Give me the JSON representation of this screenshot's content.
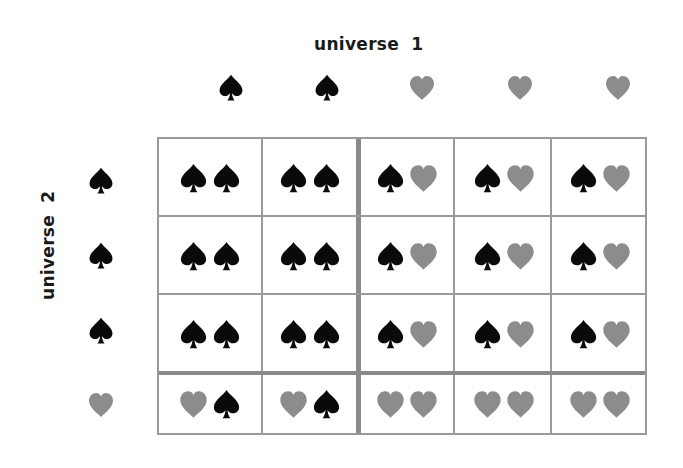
{
  "labels": {
    "universe1": "universe 1",
    "universe2": "universe 2"
  },
  "colors": {
    "spade": "#0a0a0a",
    "heart": "#8c8c8c",
    "grid": "#9a9a9a"
  },
  "column_headers": [
    "spade",
    "spade",
    "heart",
    "heart",
    "heart"
  ],
  "row_headers": [
    "spade",
    "spade",
    "spade",
    "heart"
  ],
  "cells": [
    [
      [
        "spade",
        "spade"
      ],
      [
        "spade",
        "spade"
      ],
      [
        "spade",
        "heart"
      ],
      [
        "spade",
        "heart"
      ],
      [
        "spade",
        "heart"
      ]
    ],
    [
      [
        "spade",
        "spade"
      ],
      [
        "spade",
        "spade"
      ],
      [
        "spade",
        "heart"
      ],
      [
        "spade",
        "heart"
      ],
      [
        "spade",
        "heart"
      ]
    ],
    [
      [
        "spade",
        "spade"
      ],
      [
        "spade",
        "spade"
      ],
      [
        "spade",
        "heart"
      ],
      [
        "spade",
        "heart"
      ],
      [
        "spade",
        "heart"
      ]
    ],
    [
      [
        "heart",
        "spade"
      ],
      [
        "heart",
        "spade"
      ],
      [
        "heart",
        "heart"
      ],
      [
        "heart",
        "heart"
      ],
      [
        "heart",
        "heart"
      ]
    ]
  ]
}
